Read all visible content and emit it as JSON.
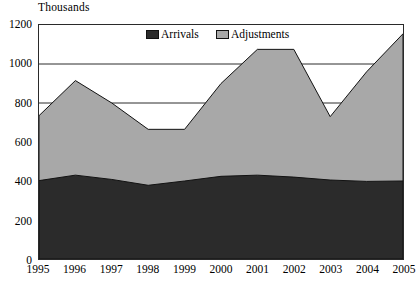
{
  "chart_data": {
    "type": "area",
    "stacked": true,
    "title": "Thousands",
    "xlabel": "",
    "ylabel": "Thousands",
    "ylim": [
      0,
      1200
    ],
    "ytick_step": 200,
    "yticks": [
      0,
      200,
      400,
      600,
      800,
      1000,
      1200
    ],
    "grid": "horizontal",
    "legend_position": "top-center-inside",
    "categories": [
      "1995",
      "1996",
      "1997",
      "1998",
      "1999",
      "2000",
      "2001",
      "2002",
      "2003",
      "2004",
      "2005"
    ],
    "series": [
      {
        "name": "Arrivals",
        "color": "#2b2b2b",
        "values": [
          402,
          430,
          408,
          378,
          400,
          424,
          430,
          420,
          405,
          398,
          400
        ]
      },
      {
        "name": "Adjustments",
        "color": "#a8a8a8",
        "values": [
          333,
          485,
          392,
          287,
          265,
          476,
          645,
          655,
          325,
          562,
          755
        ]
      }
    ],
    "totals": [
      735,
      915,
      800,
      665,
      665,
      900,
      1075,
      1075,
      730,
      960,
      1155
    ]
  },
  "legend": {
    "items": [
      {
        "label": "Arrivals",
        "swatch": "#2b2b2b"
      },
      {
        "label": "Adjustments",
        "swatch": "#a8a8a8"
      }
    ]
  },
  "axis": {
    "title": "Thousands"
  }
}
